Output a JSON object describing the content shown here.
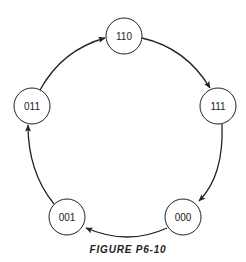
{
  "diagram": {
    "type": "state-diagram",
    "caption": "FIGURE P6-10",
    "colors": {
      "stroke": "#222222",
      "background": "#ffffff"
    },
    "states": [
      {
        "id": "s110",
        "label": "110",
        "cx": 124,
        "cy": 36
      },
      {
        "id": "s111",
        "label": "111",
        "cx": 218,
        "cy": 106
      },
      {
        "id": "s000",
        "label": "000",
        "cx": 183,
        "cy": 217
      },
      {
        "id": "s001",
        "label": "001",
        "cx": 67,
        "cy": 217
      },
      {
        "id": "s011",
        "label": "011",
        "cx": 32,
        "cy": 106
      }
    ],
    "transitions": [
      {
        "from": "011",
        "to": "110"
      },
      {
        "from": "110",
        "to": "111"
      },
      {
        "from": "111",
        "to": "000"
      },
      {
        "from": "000",
        "to": "001"
      },
      {
        "from": "001",
        "to": "011"
      }
    ]
  }
}
